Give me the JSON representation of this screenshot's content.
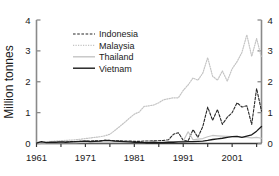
{
  "chart_data": {
    "type": "line",
    "title": "",
    "subtitle": "",
    "xlabel": "",
    "ylabel": "Million tonnes",
    "ylabel_right": "",
    "xlim": [
      1961,
      2007
    ],
    "ylim": [
      0,
      4
    ],
    "grid": false,
    "legend_position": "top-left-inside",
    "dual_y_axis": true,
    "y_ticks": [
      0,
      1,
      2,
      3,
      4
    ],
    "y_tick_labels": [
      "0",
      "1",
      "2",
      "3",
      "4"
    ],
    "y_ticks_right": [
      0,
      1,
      2,
      3,
      4
    ],
    "y_tick_labels_right": [
      "0",
      "1",
      "2",
      "3",
      "4"
    ],
    "x_ticks": [
      1961,
      1966,
      1971,
      1976,
      1981,
      1986,
      1991,
      1996,
      2001,
      2006
    ],
    "x_tick_labels": [
      "1961",
      "",
      "1971",
      "",
      "1981",
      "",
      "1991",
      "",
      "2001",
      ""
    ],
    "x_labeled_ticks": [
      1961,
      1971,
      1981,
      1991,
      2001
    ],
    "x": [
      1961,
      1962,
      1963,
      1964,
      1965,
      1966,
      1967,
      1968,
      1969,
      1970,
      1971,
      1972,
      1973,
      1974,
      1975,
      1976,
      1977,
      1978,
      1979,
      1980,
      1981,
      1982,
      1983,
      1984,
      1985,
      1986,
      1987,
      1988,
      1989,
      1990,
      1991,
      1992,
      1993,
      1994,
      1995,
      1996,
      1997,
      1998,
      1999,
      2000,
      2001,
      2002,
      2003,
      2004,
      2005,
      2006,
      2007
    ],
    "series": [
      {
        "name": "Indonesia",
        "color": "#262626",
        "style": "dashed",
        "width": 1.1,
        "values": [
          0.02,
          0.03,
          0.03,
          0.04,
          0.04,
          0.05,
          0.05,
          0.06,
          0.06,
          0.07,
          0.08,
          0.08,
          0.09,
          0.09,
          0.1,
          0.1,
          0.09,
          0.09,
          0.08,
          0.08,
          0.07,
          0.07,
          0.08,
          0.08,
          0.09,
          0.09,
          0.1,
          0.12,
          0.3,
          0.35,
          0.1,
          0.08,
          0.45,
          0.2,
          0.55,
          1.18,
          0.75,
          1.1,
          0.62,
          0.85,
          1.0,
          1.32,
          1.18,
          1.22,
          0.62,
          1.78,
          1.05
        ]
      },
      {
        "name": "Malaysia",
        "color": "#c4c4c4",
        "style": "dotted",
        "width": 1.2,
        "values": [
          0.04,
          0.05,
          0.06,
          0.07,
          0.08,
          0.09,
          0.1,
          0.11,
          0.12,
          0.14,
          0.16,
          0.18,
          0.2,
          0.22,
          0.25,
          0.3,
          0.42,
          0.55,
          0.68,
          0.82,
          0.95,
          1.02,
          1.2,
          1.22,
          1.25,
          1.32,
          1.42,
          1.45,
          1.48,
          1.48,
          1.72,
          1.9,
          2.12,
          2.05,
          2.28,
          2.78,
          2.18,
          2.05,
          2.35,
          2.02,
          2.42,
          2.65,
          2.95,
          3.52,
          2.82,
          3.4,
          2.78
        ]
      },
      {
        "name": "Thailand",
        "color": "#c4c4c4",
        "style": "solid",
        "width": 1.2,
        "values": [
          0.01,
          0.01,
          0.01,
          0.02,
          0.02,
          0.02,
          0.02,
          0.02,
          0.02,
          0.03,
          0.03,
          0.03,
          0.03,
          0.03,
          0.03,
          0.03,
          0.03,
          0.03,
          0.03,
          0.03,
          0.03,
          0.03,
          0.03,
          0.04,
          0.04,
          0.04,
          0.05,
          0.05,
          0.06,
          0.06,
          0.08,
          0.38,
          0.12,
          0.14,
          0.16,
          0.22,
          0.26,
          0.25,
          0.24,
          0.23,
          0.22,
          0.22,
          0.2,
          0.2,
          0.18,
          0.2,
          0.17
        ]
      },
      {
        "name": "Vietnam",
        "color": "#1a1a1a",
        "style": "solid",
        "width": 1.3,
        "values": [
          0.01,
          0.06,
          0.03,
          0.04,
          0.04,
          0.05,
          0.04,
          0.05,
          0.06,
          0.07,
          0.08,
          0.06,
          0.07,
          0.08,
          0.1,
          0.09,
          0.08,
          0.07,
          0.06,
          0.05,
          0.04,
          0.04,
          0.03,
          0.03,
          0.04,
          0.03,
          0.03,
          0.04,
          0.04,
          0.05,
          0.05,
          0.06,
          0.06,
          0.07,
          0.08,
          0.1,
          0.13,
          0.15,
          0.17,
          0.2,
          0.22,
          0.23,
          0.2,
          0.24,
          0.28,
          0.4,
          0.55
        ]
      }
    ],
    "legend_entries": [
      {
        "label": "Indonesia",
        "color": "#262626",
        "style": "dashed"
      },
      {
        "label": "Malaysia",
        "color": "#c4c4c4",
        "style": "dotted"
      },
      {
        "label": "Thailand",
        "color": "#c4c4c4",
        "style": "solid"
      },
      {
        "label": "Vietnam",
        "color": "#1a1a1a",
        "style": "solid"
      }
    ]
  },
  "axes": {
    "y_label": "Million tonnes"
  },
  "colors": {
    "axis": "#7a7a7a",
    "text": "#1a1a1a",
    "background": "#ffffff"
  }
}
